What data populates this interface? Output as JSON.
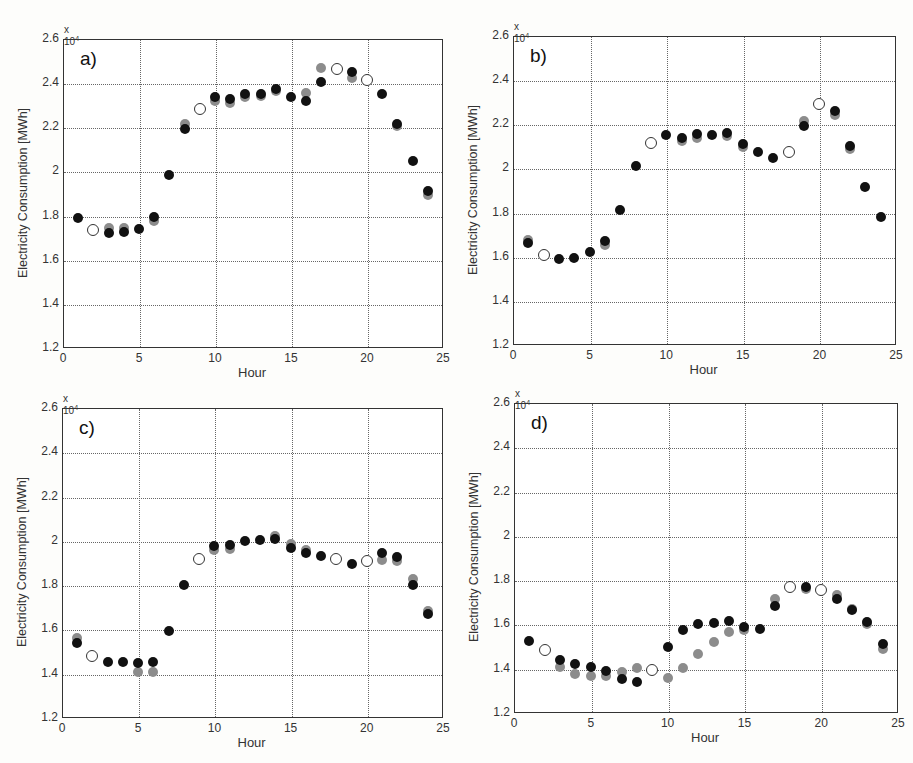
{
  "figure": {
    "xlabel": "Hour",
    "ylabel": "Electricity Consumption [MWh]",
    "exponent_base": "x 10",
    "exponent_power": "4",
    "ytick_labels": [
      "1.2",
      "1.4",
      "1.6",
      "1.8",
      "2",
      "2.2",
      "2.4",
      "2.6"
    ],
    "xtick_labels": [
      "0",
      "5",
      "10",
      "15",
      "20",
      "25"
    ],
    "colors": {
      "black": "#111111",
      "gray": "#8c8c8c",
      "open_edge": "#333333"
    }
  },
  "chart_data": [
    {
      "type": "scatter",
      "panel_label": "a)",
      "frame": {
        "left": 63,
        "top": 39,
        "right": 443,
        "bottom": 348
      },
      "xlabel": "Hour",
      "ylabel": "Electricity Consumption [MWh]",
      "y_multiplier": "x 10^4",
      "xlim": [
        0,
        25
      ],
      "ylim": [
        1.2,
        2.6
      ],
      "xticks": [
        0,
        5,
        10,
        15,
        20,
        25
      ],
      "yticks": [
        1.2,
        1.4,
        1.6,
        1.8,
        2.0,
        2.2,
        2.4,
        2.6
      ],
      "grid": true,
      "series": [
        {
          "name": "gray",
          "style": "filled-gray",
          "points": [
            [
              3,
              1.745
            ],
            [
              4,
              1.745
            ],
            [
              6,
              1.775
            ],
            [
              8,
              2.215
            ],
            [
              10,
              2.32
            ],
            [
              11,
              2.31
            ],
            [
              12,
              2.335
            ],
            [
              13,
              2.34
            ],
            [
              14,
              2.365
            ],
            [
              16,
              2.355
            ],
            [
              17,
              2.47
            ],
            [
              19,
              2.425
            ],
            [
              22,
              2.205
            ],
            [
              24,
              1.895
            ]
          ]
        },
        {
          "name": "black",
          "style": "filled-black",
          "points": [
            [
              1,
              1.79
            ],
            [
              3,
              1.72
            ],
            [
              4,
              1.725
            ],
            [
              5,
              1.74
            ],
            [
              6,
              1.795
            ],
            [
              7,
              1.985
            ],
            [
              8,
              2.19
            ],
            [
              10,
              2.335
            ],
            [
              11,
              2.33
            ],
            [
              12,
              2.35
            ],
            [
              13,
              2.35
            ],
            [
              14,
              2.375
            ],
            [
              15,
              2.335
            ],
            [
              16,
              2.32
            ],
            [
              17,
              2.405
            ],
            [
              19,
              2.45
            ],
            [
              21,
              2.35
            ],
            [
              22,
              2.215
            ],
            [
              23,
              2.045
            ],
            [
              24,
              1.91
            ]
          ]
        },
        {
          "name": "open",
          "style": "open-circle",
          "points": [
            [
              2,
              1.735
            ],
            [
              9,
              2.285
            ],
            [
              18,
              2.465
            ],
            [
              20,
              2.415
            ]
          ]
        }
      ]
    },
    {
      "type": "scatter",
      "panel_label": "b)",
      "frame": {
        "left": 513,
        "top": 36,
        "right": 896,
        "bottom": 345
      },
      "xlabel": "Hour",
      "ylabel": "Electricity Consumption [MWh]",
      "y_multiplier": "x 10^4",
      "xlim": [
        0,
        25
      ],
      "ylim": [
        1.2,
        2.6
      ],
      "xticks": [
        0,
        5,
        10,
        15,
        20,
        25
      ],
      "yticks": [
        1.2,
        1.4,
        1.6,
        1.8,
        2.0,
        2.2,
        2.4,
        2.6
      ],
      "grid": true,
      "series": [
        {
          "name": "gray",
          "style": "filled-gray",
          "points": [
            [
              1,
              1.675
            ],
            [
              6,
              1.655
            ],
            [
              11,
              2.125
            ],
            [
              12,
              2.14
            ],
            [
              14,
              2.145
            ],
            [
              15,
              2.095
            ],
            [
              19,
              2.215
            ],
            [
              21,
              2.24
            ],
            [
              22,
              2.09
            ]
          ]
        },
        {
          "name": "black",
          "style": "filled-black",
          "points": [
            [
              1,
              1.66
            ],
            [
              3,
              1.59
            ],
            [
              4,
              1.595
            ],
            [
              5,
              1.62
            ],
            [
              6,
              1.67
            ],
            [
              7,
              1.81
            ],
            [
              8,
              2.01
            ],
            [
              10,
              2.15
            ],
            [
              11,
              2.14
            ],
            [
              12,
              2.155
            ],
            [
              13,
              2.15
            ],
            [
              14,
              2.16
            ],
            [
              15,
              2.11
            ],
            [
              16,
              2.075
            ],
            [
              17,
              2.045
            ],
            [
              19,
              2.19
            ],
            [
              21,
              2.26
            ],
            [
              22,
              2.1
            ],
            [
              23,
              1.915
            ],
            [
              24,
              1.78
            ]
          ]
        },
        {
          "name": "open",
          "style": "open-circle",
          "points": [
            [
              2,
              1.61
            ],
            [
              9,
              2.115
            ],
            [
              18,
              2.075
            ],
            [
              20,
              2.29
            ]
          ]
        }
      ]
    },
    {
      "type": "scatter",
      "panel_label": "c)",
      "frame": {
        "left": 62,
        "top": 408,
        "right": 443,
        "bottom": 718
      },
      "xlabel": "Hour",
      "ylabel": "Electricity Consumption [MWh]",
      "y_multiplier": "x 10^4",
      "xlim": [
        0,
        25
      ],
      "ylim": [
        1.2,
        2.6
      ],
      "xticks": [
        0,
        5,
        10,
        15,
        20,
        25
      ],
      "yticks": [
        1.2,
        1.4,
        1.6,
        1.8,
        2.0,
        2.2,
        2.4,
        2.6
      ],
      "grid": true,
      "series": [
        {
          "name": "gray",
          "style": "filled-gray",
          "points": [
            [
              1,
              1.56
            ],
            [
              5,
              1.41
            ],
            [
              6,
              1.41
            ],
            [
              10,
              1.96
            ],
            [
              11,
              1.965
            ],
            [
              14,
              2.02
            ],
            [
              15,
              1.985
            ],
            [
              16,
              1.96
            ],
            [
              21,
              1.915
            ],
            [
              22,
              1.91
            ],
            [
              23,
              1.83
            ],
            [
              24,
              1.685
            ]
          ]
        },
        {
          "name": "black",
          "style": "filled-black",
          "points": [
            [
              1,
              1.54
            ],
            [
              3,
              1.455
            ],
            [
              4,
              1.455
            ],
            [
              5,
              1.45
            ],
            [
              6,
              1.455
            ],
            [
              7,
              1.595
            ],
            [
              8,
              1.8
            ],
            [
              10,
              1.975
            ],
            [
              11,
              1.98
            ],
            [
              12,
              2.0
            ],
            [
              13,
              2.005
            ],
            [
              14,
              2.01
            ],
            [
              15,
              1.97
            ],
            [
              16,
              1.945
            ],
            [
              17,
              1.93
            ],
            [
              19,
              1.895
            ],
            [
              21,
              1.945
            ],
            [
              22,
              1.925
            ],
            [
              23,
              1.8
            ],
            [
              24,
              1.67
            ]
          ]
        },
        {
          "name": "open",
          "style": "open-circle",
          "points": [
            [
              2,
              1.48
            ],
            [
              9,
              1.92
            ],
            [
              18,
              1.92
            ],
            [
              20,
              1.91
            ]
          ]
        }
      ]
    },
    {
      "type": "scatter",
      "panel_label": "d)",
      "frame": {
        "left": 514,
        "top": 403,
        "right": 898,
        "bottom": 713
      },
      "xlabel": "Hour",
      "ylabel": "Electricity Consumption [MWh]",
      "y_multiplier": "x 10^4",
      "xlim": [
        0,
        25
      ],
      "ylim": [
        1.2,
        2.6
      ],
      "xticks": [
        0,
        5,
        10,
        15,
        20,
        25
      ],
      "yticks": [
        1.2,
        1.4,
        1.6,
        1.8,
        2.0,
        2.2,
        2.4,
        2.6
      ],
      "grid": true,
      "series": [
        {
          "name": "gray",
          "style": "filled-gray",
          "points": [
            [
              3,
              1.41
            ],
            [
              4,
              1.375
            ],
            [
              5,
              1.365
            ],
            [
              6,
              1.365
            ],
            [
              7,
              1.385
            ],
            [
              8,
              1.405
            ],
            [
              10,
              1.36
            ],
            [
              11,
              1.405
            ],
            [
              12,
              1.465
            ],
            [
              13,
              1.52
            ],
            [
              14,
              1.565
            ],
            [
              15,
              1.575
            ],
            [
              17,
              1.715
            ],
            [
              19,
              1.76
            ],
            [
              21,
              1.735
            ],
            [
              22,
              1.67
            ],
            [
              23,
              1.6
            ],
            [
              24,
              1.49
            ]
          ]
        },
        {
          "name": "black",
          "style": "filled-black",
          "points": [
            [
              1,
              1.525
            ],
            [
              3,
              1.44
            ],
            [
              4,
              1.42
            ],
            [
              5,
              1.41
            ],
            [
              6,
              1.39
            ],
            [
              7,
              1.355
            ],
            [
              8,
              1.34
            ],
            [
              10,
              1.5
            ],
            [
              11,
              1.575
            ],
            [
              12,
              1.6
            ],
            [
              13,
              1.605
            ],
            [
              14,
              1.615
            ],
            [
              15,
              1.59
            ],
            [
              16,
              1.58
            ],
            [
              17,
              1.685
            ],
            [
              19,
              1.77
            ],
            [
              21,
              1.715
            ],
            [
              22,
              1.665
            ],
            [
              23,
              1.61
            ],
            [
              24,
              1.51
            ]
          ]
        },
        {
          "name": "open",
          "style": "open-circle",
          "points": [
            [
              2,
              1.485
            ],
            [
              9,
              1.395
            ],
            [
              18,
              1.77
            ],
            [
              20,
              1.755
            ]
          ]
        }
      ]
    }
  ]
}
